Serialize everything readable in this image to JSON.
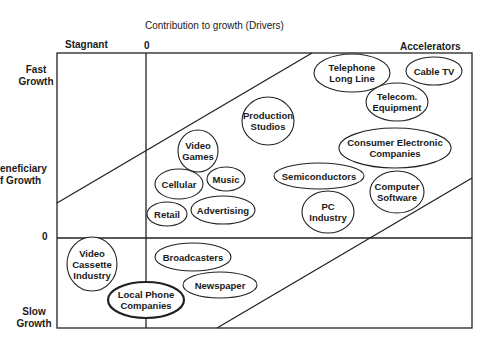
{
  "title": "Contribution to growth (Drivers)",
  "top_labels": {
    "left": "Stagnant",
    "zero": "0",
    "right": "Accelerators"
  },
  "side_labels": {
    "top": [
      "Fast",
      "Growth"
    ],
    "middle": [
      "eneficiary",
      "f Growth"
    ],
    "zero": "0",
    "bottom": [
      "Slow",
      "Growth"
    ]
  },
  "colors": {
    "line": "#222222",
    "background": "#ffffff"
  },
  "industries": [
    {
      "id": "telephone-long-line",
      "lines": [
        "Telephone",
        "Long Line"
      ],
      "cx": 352,
      "cy": 73,
      "rx": 38,
      "ry": 19
    },
    {
      "id": "cable-tv",
      "lines": [
        "Cable TV"
      ],
      "cx": 434,
      "cy": 71,
      "rx": 28,
      "ry": 14
    },
    {
      "id": "telecom-equipment",
      "lines": [
        "Telecom.",
        "Equipment"
      ],
      "cx": 397,
      "cy": 102,
      "rx": 31,
      "ry": 19
    },
    {
      "id": "production-studios",
      "lines": [
        "Production",
        "Studios"
      ],
      "cx": 268,
      "cy": 121,
      "rx": 26,
      "ry": 24
    },
    {
      "id": "consumer-electronic-companies",
      "lines": [
        "Consumer Electronic",
        "Companies"
      ],
      "cx": 395,
      "cy": 148,
      "rx": 56,
      "ry": 20
    },
    {
      "id": "video-games",
      "lines": [
        "Video",
        "Games"
      ],
      "cx": 198,
      "cy": 151,
      "rx": 20,
      "ry": 21
    },
    {
      "id": "semiconductors",
      "lines": [
        "Semiconductors"
      ],
      "cx": 319,
      "cy": 176,
      "rx": 45,
      "ry": 13
    },
    {
      "id": "music",
      "lines": [
        "Music"
      ],
      "cx": 226,
      "cy": 179,
      "rx": 19,
      "ry": 12
    },
    {
      "id": "cellular",
      "lines": [
        "Cellular"
      ],
      "cx": 179,
      "cy": 184,
      "rx": 24,
      "ry": 15
    },
    {
      "id": "computer-software",
      "lines": [
        "Computer",
        "Software"
      ],
      "cx": 397,
      "cy": 192,
      "rx": 27,
      "ry": 21
    },
    {
      "id": "advertising",
      "lines": [
        "Advertising"
      ],
      "cx": 223,
      "cy": 210,
      "rx": 32,
      "ry": 14
    },
    {
      "id": "retail",
      "lines": [
        "Retail"
      ],
      "cx": 167,
      "cy": 214,
      "rx": 20,
      "ry": 12
    },
    {
      "id": "pc-industry",
      "lines": [
        "PC",
        "Industry"
      ],
      "cx": 328,
      "cy": 212,
      "rx": 26,
      "ry": 21
    },
    {
      "id": "video-cassette-industry",
      "lines": [
        "Video",
        "Cassette",
        "Industry"
      ],
      "cx": 92,
      "cy": 264,
      "rx": 25,
      "ry": 27
    },
    {
      "id": "broadcasters",
      "lines": [
        "Broadcasters"
      ],
      "cx": 193,
      "cy": 257,
      "rx": 38,
      "ry": 14
    },
    {
      "id": "newspaper",
      "lines": [
        "Newspaper"
      ],
      "cx": 220,
      "cy": 285,
      "rx": 37,
      "ry": 13
    },
    {
      "id": "local-phone-companies",
      "lines": [
        "Local Phone",
        "Companies"
      ],
      "cx": 146,
      "cy": 300,
      "rx": 38,
      "ry": 18,
      "bold": true
    }
  ]
}
